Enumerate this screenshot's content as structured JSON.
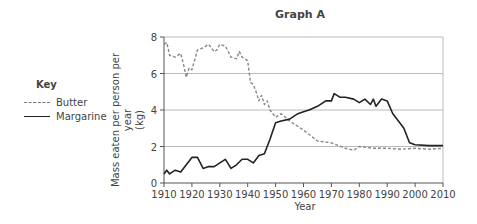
{
  "chart_data": {
    "type": "line",
    "title": "Graph A",
    "xlabel": "Year",
    "ylabel": "Mass eaten per person per year (kg)",
    "xlim": [
      1910,
      2010
    ],
    "ylim": [
      0,
      8
    ],
    "xticks": [
      1910,
      1920,
      1930,
      1940,
      1950,
      1960,
      1970,
      1980,
      1990,
      2000,
      2010
    ],
    "yticks": [
      0,
      2,
      4,
      6,
      8
    ],
    "grid": "horizontal",
    "legend": {
      "title": "Key",
      "position": "left",
      "entries": [
        "Butter",
        "Margarine"
      ]
    },
    "series": [
      {
        "name": "Butter",
        "style": "dashed",
        "x": [
          1910,
          1911,
          1912,
          1914,
          1916,
          1917,
          1918,
          1919,
          1920,
          1922,
          1924,
          1926,
          1928,
          1929,
          1930,
          1932,
          1934,
          1936,
          1937,
          1938,
          1940,
          1941,
          1942,
          1943,
          1944,
          1945,
          1946,
          1947,
          1948,
          1950,
          1952,
          1955,
          1960,
          1965,
          1970,
          1975,
          1978,
          1980,
          1985,
          1990,
          1995,
          2000,
          2005,
          2010
        ],
        "values": [
          7.6,
          7.7,
          7.0,
          6.9,
          7.1,
          6.5,
          5.8,
          6.3,
          6.2,
          7.3,
          7.4,
          7.6,
          7.2,
          7.3,
          7.6,
          7.5,
          6.9,
          6.8,
          7.2,
          6.9,
          6.7,
          5.5,
          5.4,
          5.0,
          4.5,
          4.8,
          4.3,
          4.5,
          4.0,
          3.6,
          3.8,
          3.4,
          2.9,
          2.3,
          2.2,
          1.9,
          1.8,
          2.0,
          1.9,
          1.9,
          1.85,
          1.9,
          1.85,
          1.9
        ]
      },
      {
        "name": "Margarine",
        "style": "solid",
        "x": [
          1910,
          1911,
          1912,
          1914,
          1916,
          1918,
          1920,
          1922,
          1924,
          1926,
          1928,
          1930,
          1932,
          1934,
          1936,
          1938,
          1940,
          1942,
          1944,
          1946,
          1948,
          1950,
          1952,
          1955,
          1958,
          1960,
          1962,
          1965,
          1968,
          1970,
          1971,
          1973,
          1975,
          1978,
          1980,
          1982,
          1984,
          1985,
          1986,
          1988,
          1990,
          1992,
          1994,
          1996,
          1998,
          2000,
          2005,
          2010
        ],
        "values": [
          0.5,
          0.7,
          0.5,
          0.7,
          0.6,
          1.0,
          1.4,
          1.4,
          0.8,
          0.9,
          0.9,
          1.1,
          1.3,
          0.8,
          1.0,
          1.3,
          1.3,
          1.1,
          1.5,
          1.6,
          2.4,
          3.3,
          3.4,
          3.5,
          3.8,
          3.9,
          4.0,
          4.2,
          4.5,
          4.5,
          4.9,
          4.7,
          4.7,
          4.6,
          4.4,
          4.6,
          4.3,
          4.6,
          4.2,
          4.6,
          4.5,
          3.8,
          3.4,
          3.0,
          2.2,
          2.1,
          2.05,
          2.05
        ]
      }
    ]
  },
  "title": "Graph A",
  "key": {
    "title": "Key",
    "items": [
      "Butter",
      "Margarine"
    ]
  },
  "axes": {
    "xlabel": "Year",
    "ylabel_line1": "Mass eaten per person per year",
    "ylabel_line2": "(kg)"
  }
}
